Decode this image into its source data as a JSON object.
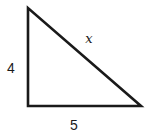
{
  "figure": {
    "type": "right-triangle",
    "labels": {
      "left_side": "4",
      "bottom_side": "5",
      "hypotenuse": "x"
    },
    "colors": {
      "line": "#1a1a1a",
      "background": "#ffffff"
    }
  }
}
